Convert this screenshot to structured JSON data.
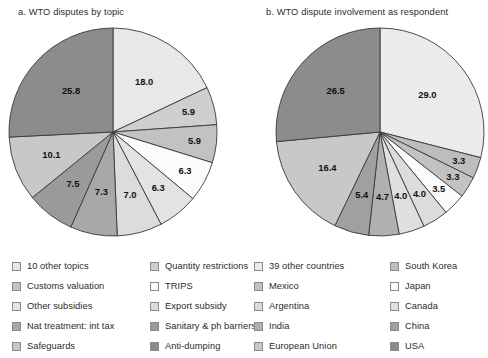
{
  "figure": {
    "width": 488,
    "height": 358,
    "background": "#ffffff"
  },
  "panels": [
    {
      "id": "panel-a",
      "title": "a. WTO disputes by topic",
      "legend": [
        {
          "label": "10 other topics",
          "color": "#e8e8e8"
        },
        {
          "label": "Customs valuation",
          "color": "#c2c2c2"
        },
        {
          "label": "Other subsidies",
          "color": "#e3e3e3"
        },
        {
          "label": "Nat treatment: int tax",
          "color": "#a8a8a8"
        },
        {
          "label": "Safeguards",
          "color": "#c8c8c8"
        },
        {
          "label": "Quantity restrictions",
          "color": "#cfcfcf"
        },
        {
          "label": "TRIPS",
          "color": "#fbfbfb"
        },
        {
          "label": "Export subsidy",
          "color": "#dcdcdc"
        },
        {
          "label": "Sanitary & ph barriers",
          "color": "#9a9a9a"
        },
        {
          "label": "Anti-dumping",
          "color": "#8c8c8c"
        }
      ]
    },
    {
      "id": "panel-b",
      "title": "b. WTO dispute involvement as respondent",
      "legend": [
        {
          "label": "39 other countries",
          "color": "#ebebeb"
        },
        {
          "label": "Mexico",
          "color": "#c2c2c2"
        },
        {
          "label": "Argentina",
          "color": "#dcdcdc"
        },
        {
          "label": "India",
          "color": "#b0b0b0"
        },
        {
          "label": "European Union",
          "color": "#c8c8c8"
        },
        {
          "label": "South Korea",
          "color": "#bdbdbd"
        },
        {
          "label": "Japan",
          "color": "#fbfbfb"
        },
        {
          "label": "Canada",
          "color": "#dfdfdf"
        },
        {
          "label": "China",
          "color": "#a0a0a0"
        },
        {
          "label": "USA",
          "color": "#8c8c8c"
        }
      ]
    }
  ],
  "chart_data": [
    {
      "type": "pie",
      "id": "panel-a",
      "title": "a. WTO disputes by topic",
      "start_angle_deg": 0,
      "direction": "clockwise",
      "labels": [
        "10 other topics",
        "Quantity restrictions",
        "Customs valuation",
        "TRIPS",
        "Other subsidies",
        "Export subsidy",
        "Nat treatment: int tax",
        "Sanitary & ph barriers",
        "Safeguards",
        "Anti-dumping"
      ],
      "values": [
        18.0,
        5.9,
        5.9,
        6.3,
        6.3,
        7.0,
        7.3,
        7.5,
        10.1,
        25.8
      ],
      "data_labels": [
        "18.0",
        "5.9",
        "5.9",
        "6.3",
        "6.3",
        "7.0",
        "7.3",
        "7.5",
        "10.1",
        "25.8"
      ],
      "colors": [
        "#e8e8e8",
        "#cfcfcf",
        "#c2c2c2",
        "#fbfbfb",
        "#e3e3e3",
        "#dcdcdc",
        "#a8a8a8",
        "#9a9a9a",
        "#c8c8c8",
        "#8c8c8c"
      ],
      "units": "percent",
      "legend_position": "bottom"
    },
    {
      "type": "pie",
      "id": "panel-b",
      "title": "b. WTO dispute involvement as respondent",
      "start_angle_deg": 0,
      "direction": "clockwise",
      "labels": [
        "39 other countries",
        "South Korea",
        "Mexico",
        "Japan",
        "Argentina",
        "Canada",
        "India",
        "China",
        "European Union",
        "USA"
      ],
      "values": [
        29.0,
        3.3,
        3.3,
        3.5,
        4.0,
        4.0,
        4.7,
        5.4,
        16.4,
        26.5
      ],
      "data_labels": [
        "29.0",
        "3.3",
        "3.3",
        "3.5",
        "4.0",
        "4.0",
        "4.7",
        "5.4",
        "16.4",
        "26.5"
      ],
      "colors": [
        "#ebebeb",
        "#bdbdbd",
        "#c2c2c2",
        "#fbfbfb",
        "#dcdcdc",
        "#dfdfdf",
        "#b0b0b0",
        "#a0a0a0",
        "#c8c8c8",
        "#8c8c8c"
      ],
      "units": "percent",
      "legend_position": "bottom"
    }
  ]
}
